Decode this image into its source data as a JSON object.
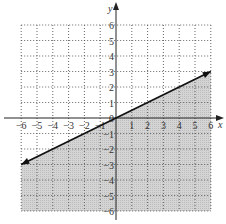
{
  "chart_data": {
    "type": "line",
    "title": "",
    "xlabel": "x",
    "ylabel": "y",
    "xlim": [
      -6,
      6
    ],
    "ylim": [
      -6,
      6
    ],
    "grid": true,
    "grid_style": "dotted",
    "x_ticks": [
      -6,
      -5,
      -4,
      -3,
      -2,
      -1,
      0,
      1,
      2,
      3,
      4,
      5,
      6
    ],
    "y_ticks": [
      -6,
      -5,
      -4,
      -3,
      -2,
      -1,
      0,
      1,
      2,
      3,
      4,
      5,
      6
    ],
    "x_tick_labels": [
      "−6",
      "−5",
      "−4",
      "−3",
      "−2",
      "−1",
      "0",
      "1",
      "2",
      "3",
      "4",
      "5",
      "6"
    ],
    "y_tick_labels": [
      "−6",
      "−5",
      "−4",
      "−3",
      "−2",
      "−1",
      "0",
      "1",
      "2",
      "3",
      "4",
      "5",
      "6"
    ],
    "series": [
      {
        "name": "boundary line y = x/2",
        "equation": "y = 0.5x",
        "x": [
          -6,
          6
        ],
        "y": [
          -3,
          3
        ],
        "style": "solid",
        "arrows": "both",
        "color": "#111111"
      }
    ],
    "shaded_region": {
      "description": "half-plane below the line",
      "inequality": "y <= 0.5x",
      "fill_color": "#cfcfcf"
    }
  },
  "colors": {
    "axis": "#222222",
    "grid": "#555555",
    "shade": "#cfcfcf",
    "line": "#111111"
  }
}
